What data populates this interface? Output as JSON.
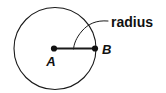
{
  "figure": {
    "type": "geometry-diagram",
    "background_color": "#ffffff",
    "stroke_color": "#1a1a1a",
    "text_color": "#111111",
    "width": 166,
    "height": 93
  },
  "circle": {
    "name": "circle A",
    "center_x": 55,
    "center_y": 48.5,
    "radius": 41,
    "stroke_width": 1.1
  },
  "points": [
    {
      "id": "A",
      "label": "A",
      "role": "center",
      "x": 54,
      "y": 48.5,
      "label_x": 51,
      "label_y": 66,
      "dot_radius": 3.1
    },
    {
      "id": "B",
      "label": "B",
      "role": "on-circle",
      "x": 95,
      "y": 48.5,
      "label_x": 102,
      "label_y": 54,
      "dot_radius": 3.1
    }
  ],
  "segments": [
    {
      "id": "radius-segment",
      "from": "A",
      "to": "B",
      "x1": 54,
      "y1": 48.5,
      "x2": 95,
      "y2": 48.5,
      "stroke_width": 2.0
    }
  ],
  "callout": {
    "label": "radius",
    "text_x": 111,
    "text_y": 27,
    "leader_path": "M 108 21 C 96 20 88 24 82 31 C 76 38 74 44 73.5 49",
    "leader_stroke_width": 1.0
  }
}
